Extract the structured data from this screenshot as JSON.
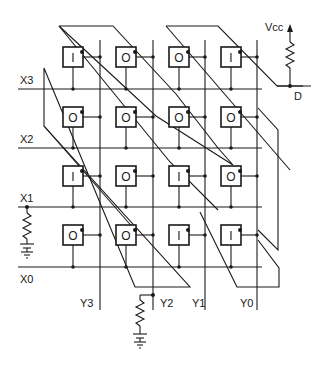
{
  "diagram": {
    "type": "memory-cell-array-schematic",
    "row_labels": [
      "X3",
      "X2",
      "X1",
      "X0"
    ],
    "column_labels": [
      "Y3",
      "Y2",
      "Y1",
      "Y0"
    ],
    "supply_label": "Vcc",
    "output_label": "D",
    "cells": [
      [
        "I",
        "O",
        "O",
        "I"
      ],
      [
        "O",
        "O",
        "O",
        "O"
      ],
      [
        "I",
        "O",
        "I",
        "O"
      ],
      [
        "O",
        "O",
        "I",
        "I"
      ]
    ],
    "line_color": "#1a1a1a",
    "background": "#ffffff"
  }
}
